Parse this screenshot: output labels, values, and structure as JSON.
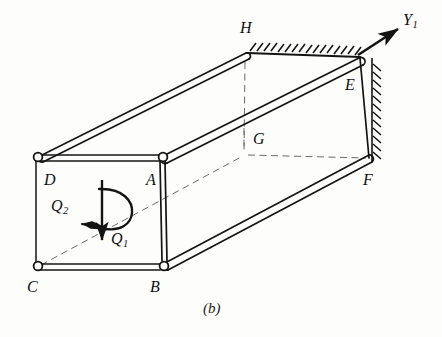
{
  "figure": {
    "caption": "(b)",
    "type": "engineering-diagram",
    "background_color": "#fdfdfb",
    "line_color": "#141414"
  },
  "vertices": [
    {
      "id": "D",
      "label": "D",
      "x": 38,
      "y": 158,
      "node_marker": "open-circle",
      "face": "front-top-left"
    },
    {
      "id": "A",
      "label": "A",
      "x": 162,
      "y": 158,
      "node_marker": "open-circle",
      "face": "front-top-right"
    },
    {
      "id": "C",
      "label": "C",
      "x": 38,
      "y": 267,
      "node_marker": "open-circle",
      "face": "front-bottom-left"
    },
    {
      "id": "B",
      "label": "B",
      "x": 162,
      "y": 267,
      "node_marker": "open-circle",
      "face": "front-bottom-right"
    },
    {
      "id": "H",
      "label": "H",
      "x": 246,
      "y": 56,
      "node_marker": "rounded-end",
      "face": "back-top-left"
    },
    {
      "id": "E",
      "label": "E",
      "x": 359,
      "y": 58,
      "node_marker": "rounded-end",
      "face": "back-top-right"
    },
    {
      "id": "G",
      "label": "G",
      "x": 244,
      "y": 155,
      "node_marker": "hidden",
      "face": "back-bottom-left"
    },
    {
      "id": "F",
      "label": "F",
      "x": 370,
      "y": 160,
      "node_marker": "rounded-end",
      "face": "back-bottom-right"
    }
  ],
  "edges": [
    {
      "from": "D",
      "to": "A",
      "style": "solid-tube"
    },
    {
      "from": "A",
      "to": "B",
      "style": "solid-tube"
    },
    {
      "from": "B",
      "to": "C",
      "style": "solid-tube"
    },
    {
      "from": "C",
      "to": "D",
      "style": "solid-tube"
    },
    {
      "from": "D",
      "to": "H",
      "style": "solid-tube"
    },
    {
      "from": "A",
      "to": "E",
      "style": "solid-tube"
    },
    {
      "from": "B",
      "to": "F",
      "style": "solid-tube"
    },
    {
      "from": "C",
      "to": "G",
      "style": "dashed-hidden"
    },
    {
      "from": "H",
      "to": "E",
      "style": "solid-line"
    },
    {
      "from": "E",
      "to": "F",
      "style": "solid-line"
    },
    {
      "from": "H",
      "to": "G",
      "style": "dashed-hidden"
    },
    {
      "from": "G",
      "to": "F",
      "style": "dashed-hidden"
    }
  ],
  "labels": {
    "D": "D",
    "A": "A",
    "C": "C",
    "B": "B",
    "H": "H",
    "E": "E",
    "G": "G",
    "F": "F"
  },
  "annotations": {
    "axis": {
      "name": "Y1",
      "base": "Y",
      "subscript": "1",
      "arrow_from": {
        "x": 359,
        "y": 56
      },
      "arrow_to": {
        "x": 401,
        "y": 28
      },
      "description": "Longitudinal axis arrow pointing up-right from corner E"
    },
    "force": {
      "name": "Q1",
      "base": "Q",
      "subscript": "1",
      "arrow_from": {
        "x": 102,
        "y": 181
      },
      "arrow_to": {
        "x": 102,
        "y": 243
      },
      "description": "Downward vertical force applied at centre of free end face"
    },
    "torque": {
      "name": "Q2",
      "base": "Q",
      "subscript": "2",
      "arc_center": {
        "x": 102,
        "y": 212
      },
      "arrow_tip": {
        "x": 78,
        "y": 228
      },
      "description": "Torque / twisting moment shown as circular arc about the vertical line with arrowhead pointing down-left"
    },
    "fixed_support": {
      "top_hatching": {
        "from": {
          "x": 248,
          "y": 51
        },
        "to": {
          "x": 358,
          "y": 56
        },
        "count": 15,
        "direction": "up-right"
      },
      "right_hatching": {
        "from": {
          "x": 372,
          "y": 62
        },
        "to": {
          "x": 372,
          "y": 160
        },
        "count": 12,
        "direction": "down-right"
      },
      "description": "Hatched ground/wall symbol indicating the far end H-E-F is built in (fixed)"
    }
  }
}
